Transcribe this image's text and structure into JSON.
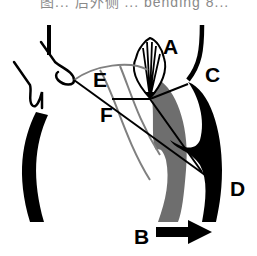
{
  "caption_fragment": "图... 后外侧 ... bending 8...",
  "diagram": {
    "type": "anatomical-schematic",
    "labels": [
      {
        "id": "A",
        "text": "A"
      },
      {
        "id": "B",
        "text": "B"
      },
      {
        "id": "C",
        "text": "C"
      },
      {
        "id": "D",
        "text": "D"
      },
      {
        "id": "E",
        "text": "E"
      },
      {
        "id": "F",
        "text": "F"
      }
    ],
    "arrow": {
      "label": "B",
      "direction": "right"
    },
    "colors": {
      "black": "#000000",
      "grey_band": "#6e6e6e",
      "thin_grey_line": "#808080",
      "background": "#ffffff"
    }
  }
}
